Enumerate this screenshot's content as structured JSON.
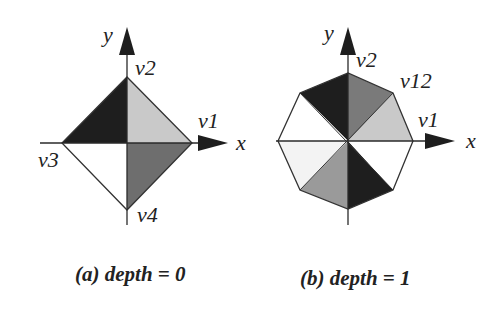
{
  "figures": [
    {
      "id": "a",
      "caption": "(a) depth = 0",
      "shape": "diamond",
      "axis_labels": {
        "x": "x",
        "y": "y"
      },
      "vertex_labels": {
        "v1": "v1",
        "v2": "v2",
        "v3": "v3",
        "v4": "v4"
      },
      "quadrant_fills": {
        "q1": "#c9c9c9",
        "q2": "#1e1e1e",
        "q3": "#ffffff",
        "q4": "#6e6e6e"
      }
    },
    {
      "id": "b",
      "caption": "(b) depth = 1",
      "shape": "octagon",
      "axis_labels": {
        "x": "x",
        "y": "y"
      },
      "vertex_labels": {
        "v1": "v1",
        "v2": "v2",
        "v12": "v12"
      },
      "sector_fills": [
        "#c9c9c9",
        "#7a7a7a",
        "#1e1e1e",
        "#ffffff",
        "#f3f3f3",
        "#9a9a9a",
        "#1e1e1e",
        "#ffffff"
      ]
    }
  ],
  "colors": {
    "stroke": "#333333",
    "axis": "#2a2a2a",
    "text": "#222222"
  }
}
